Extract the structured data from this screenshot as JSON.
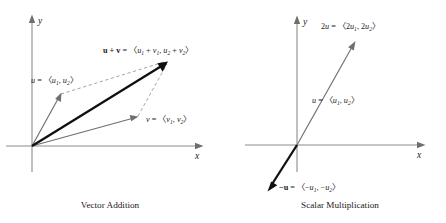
{
  "figure": {
    "panels": [
      {
        "id": "vector-addition",
        "caption": "Vector Addition",
        "axes": {
          "x_label": "x",
          "y_label": "y"
        },
        "vectors": [
          {
            "name": "u",
            "style": "gray-arrow",
            "label_main": "u",
            "label_eq": " = 〈",
            "label_parts": [
              "u",
              "1",
              ", ",
              "u",
              "2"
            ],
            "label_close": "〉",
            "from": [
              0,
              0
            ],
            "to": [
              28,
              51
            ]
          },
          {
            "name": "v",
            "style": "gray-arrow",
            "label_main": "v",
            "label_eq": " = 〈",
            "label_parts": [
              "v",
              "1",
              ", ",
              "v",
              "2"
            ],
            "label_close": "〉",
            "from": [
              0,
              0
            ],
            "to": [
              105,
              29
            ]
          },
          {
            "name": "u+v",
            "style": "black-arrow",
            "label_main": "u + v",
            "label_eq": " = 〈",
            "label_parts": [
              "u",
              "1",
              " + ",
              "v",
              "1",
              ", ",
              "u",
              "2",
              " + ",
              "v",
              "2"
            ],
            "label_close": "〉",
            "from": [
              0,
              0
            ],
            "to": [
              135,
              86
            ]
          }
        ],
        "dashed_edges": [
          {
            "from": "u-tip",
            "to": "sum-tip"
          },
          {
            "from": "v-tip",
            "to": "sum-tip"
          }
        ]
      },
      {
        "id": "scalar-multiplication",
        "caption": "Scalar Multiplication",
        "axes": {
          "x_label": "x",
          "y_label": "y"
        },
        "vectors": [
          {
            "name": "2u",
            "style": "gray-arrow",
            "label_main": "2u",
            "label_eq": " = 〈",
            "label_parts": [
              "2",
              "u",
              "1",
              ", 2",
              "u",
              "2"
            ],
            "label_close": "〉",
            "from": [
              0,
              0
            ],
            "to": [
              58,
              103
            ]
          },
          {
            "name": "u",
            "style": "midpoint-label",
            "label_main": "u",
            "label_eq": " = 〈",
            "label_parts": [
              "u",
              "1",
              ", ",
              "u",
              "2"
            ],
            "label_close": "〉",
            "from": [
              0,
              0
            ],
            "to": [
              29,
              51
            ]
          },
          {
            "name": "-u",
            "style": "black-arrow",
            "label_main": "−u",
            "label_eq": " = 〈",
            "label_parts": [
              "−",
              "u",
              "1",
              ", −",
              "u",
              "2"
            ],
            "label_close": "〉",
            "from": [
              0,
              0
            ],
            "to": [
              -29,
              -45
            ]
          }
        ]
      }
    ]
  },
  "labels": {
    "left": {
      "sum_prefix": "u + v",
      "sum_eq": " = 〈",
      "u_name": "u",
      "v_name": "v",
      "u_eq": " = 〈",
      "v_eq": " = 〈",
      "close": "〉",
      "axis_x": "x",
      "axis_y": "y",
      "caption": "Vector Addition"
    },
    "right": {
      "two_u_name": "2u",
      "two_u_eq": " = 〈",
      "u_name": "u",
      "u_eq": " = 〈",
      "neg_u_name": "−u",
      "neg_u_eq": " = 〈",
      "close": "〉",
      "axis_x": "x",
      "axis_y": "y",
      "caption": "Scalar Multiplication"
    }
  },
  "components": {
    "u1": "u",
    "u2": "u",
    "v1": "v",
    "v2": "v",
    "sub1": "1",
    "sub2": "2",
    "plus": " + ",
    "comma": ", ",
    "two": "2",
    "minus": "−"
  },
  "colors": {
    "background": "#ffffff",
    "axis": "#8c8c8c",
    "gray_vector": "#6f6f6f",
    "black_vector": "#101010",
    "dashed": "#9a9a9a",
    "text": "#1a1a1a"
  }
}
